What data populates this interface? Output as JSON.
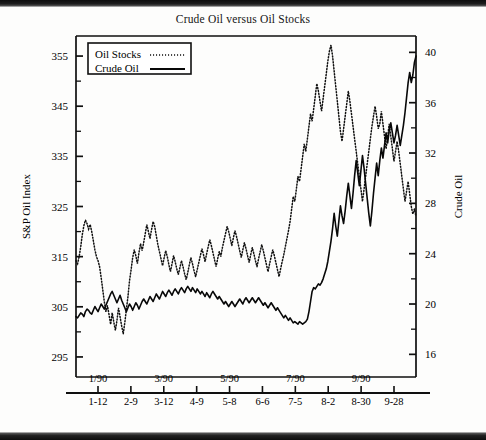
{
  "figure": {
    "title": "Crude Oil versus Oil Stocks",
    "left_axis_name": "S&P Oil Index",
    "right_axis_name": "Crude Oil"
  },
  "legend": {
    "items": [
      {
        "label": "Oil Stocks",
        "style": "dotted"
      },
      {
        "label": "Crude Oil",
        "style": "solid"
      }
    ]
  },
  "chart_data": {
    "type": "line",
    "title": "Crude Oil versus Oil Stocks",
    "xlabel": "",
    "ylabel": "S&P Oil Index",
    "y2label": "Crude Oil",
    "ylim": [
      291,
      359
    ],
    "y2lim": [
      14.2,
      41.3
    ],
    "yticks": [
      295,
      305,
      315,
      325,
      335,
      345,
      355
    ],
    "y2ticks": [
      16,
      20,
      24,
      28,
      32,
      36,
      40
    ],
    "yminor_step": 5,
    "y2minor_step": 2,
    "grid": false,
    "legend_position": "upper-left",
    "xlim": [
      0,
      38
    ],
    "xtick_major_labels": [
      "1/90",
      "3/90",
      "5/90",
      "7/90",
      "9/90"
    ],
    "xtick_major_positions": [
      3,
      11,
      19,
      27,
      35
    ],
    "xtick_labels": [
      "1-12",
      "2-9",
      "3-12",
      "4-9",
      "5-8",
      "6-6",
      "7-5",
      "8-2",
      "8-30",
      "9-28"
    ],
    "xtick_positions": [
      3,
      7,
      11,
      15,
      19,
      23,
      27,
      31,
      35,
      39
    ],
    "series": [
      {
        "name": "Oil Stocks",
        "axis": "left",
        "style": "dotted",
        "values": [
          314.2,
          313.6,
          315.0,
          317.0,
          319.4,
          321.2,
          322.3,
          321.6,
          320.5,
          321.4,
          320.0,
          318.2,
          316.4,
          315.0,
          314.2,
          313.0,
          310.8,
          308.4,
          306.0,
          304.0,
          305.2,
          303.4,
          301.5,
          303.8,
          302.0,
          300.3,
          302.2,
          304.8,
          303.0,
          301.2,
          299.6,
          301.8,
          304.5,
          307.0,
          310.2,
          312.4,
          314.8,
          316.4,
          315.2,
          313.6,
          315.8,
          317.6,
          316.2,
          317.8,
          319.6,
          321.4,
          320.0,
          318.6,
          320.4,
          322.0,
          321.0,
          319.2,
          317.4,
          316.0,
          314.6,
          313.2,
          314.8,
          316.2,
          315.0,
          313.4,
          312.0,
          313.6,
          315.2,
          314.0,
          312.6,
          311.4,
          312.8,
          314.2,
          313.0,
          311.6,
          310.4,
          311.8,
          313.4,
          314.8,
          313.6,
          312.2,
          311.0,
          312.4,
          313.8,
          315.2,
          316.6,
          315.4,
          314.0,
          315.6,
          317.0,
          318.4,
          317.2,
          315.8,
          314.4,
          313.0,
          314.6,
          316.0,
          315.0,
          316.8,
          318.2,
          319.6,
          321.0,
          320.0,
          318.6,
          317.2,
          318.8,
          320.2,
          319.0,
          317.6,
          316.2,
          314.8,
          316.4,
          317.8,
          316.6,
          315.2,
          313.8,
          315.4,
          316.8,
          315.6,
          314.2,
          313.0,
          314.6,
          316.0,
          317.4,
          316.2,
          314.8,
          313.4,
          312.0,
          313.6,
          315.0,
          316.4,
          315.2,
          313.8,
          312.4,
          311.0,
          312.6,
          314.0,
          315.4,
          317.0,
          318.6,
          320.2,
          322.0,
          324.5,
          327.0,
          326.0,
          328.5,
          331.0,
          330.0,
          332.5,
          335.0,
          337.5,
          336.0,
          338.5,
          341.0,
          343.5,
          342.0,
          344.5,
          347.0,
          349.5,
          348.0,
          346.0,
          344.0,
          346.5,
          349.0,
          351.5,
          354.0,
          356.0,
          357.2,
          355.0,
          352.0,
          349.0,
          346.0,
          343.0,
          340.0,
          338.0,
          340.5,
          343.0,
          345.5,
          348.0,
          346.0,
          343.5,
          341.0,
          338.5,
          336.0,
          333.5,
          331.0,
          328.5,
          326.0,
          328.5,
          331.0,
          333.5,
          336.0,
          338.5,
          341.0,
          343.0,
          345.0,
          343.0,
          340.5,
          341.5,
          344.0,
          341.5,
          339.0,
          336.5,
          339.0,
          341.5,
          339.0,
          336.5,
          334.0,
          336.0,
          338.0,
          336.0,
          333.5,
          331.0,
          328.5,
          326.0,
          328.0,
          330.0,
          327.5,
          325.0,
          323.5,
          324.5,
          323.0
        ]
      },
      {
        "name": "Crude Oil",
        "axis": "right",
        "style": "solid",
        "values": [
          19.0,
          18.9,
          19.1,
          19.3,
          19.2,
          19.0,
          19.4,
          19.6,
          19.5,
          19.3,
          19.2,
          19.5,
          19.8,
          19.6,
          19.4,
          19.7,
          20.0,
          19.8,
          19.6,
          19.9,
          20.2,
          20.5,
          20.8,
          21.0,
          20.7,
          20.4,
          20.1,
          20.4,
          20.7,
          20.3,
          20.0,
          19.7,
          19.4,
          19.7,
          20.0,
          19.8,
          19.5,
          19.8,
          20.1,
          19.9,
          19.6,
          19.9,
          20.2,
          20.4,
          20.2,
          20.0,
          20.3,
          20.6,
          20.4,
          20.2,
          20.5,
          20.8,
          20.6,
          20.4,
          20.7,
          21.0,
          20.8,
          20.6,
          20.9,
          21.1,
          20.9,
          20.7,
          21.0,
          21.2,
          21.0,
          20.8,
          21.1,
          21.3,
          21.1,
          20.9,
          21.2,
          21.4,
          21.2,
          21.0,
          21.3,
          21.1,
          20.9,
          21.2,
          21.0,
          20.8,
          21.0,
          20.8,
          20.6,
          20.9,
          20.7,
          20.5,
          20.8,
          21.0,
          20.8,
          20.6,
          20.4,
          20.6,
          20.4,
          20.2,
          20.0,
          20.2,
          20.0,
          19.8,
          20.0,
          20.2,
          20.0,
          19.8,
          20.0,
          20.2,
          20.4,
          20.2,
          20.0,
          20.3,
          20.5,
          20.3,
          20.1,
          20.3,
          20.5,
          20.3,
          20.1,
          20.3,
          20.5,
          20.3,
          20.1,
          19.9,
          20.1,
          19.9,
          19.7,
          19.9,
          20.1,
          19.9,
          19.7,
          19.5,
          19.7,
          19.5,
          19.3,
          19.1,
          18.9,
          19.1,
          18.9,
          18.7,
          18.9,
          18.7,
          18.5,
          18.6,
          18.5,
          18.4,
          18.6,
          18.5,
          18.4,
          18.5,
          18.6,
          18.8,
          19.4,
          20.2,
          21.0,
          21.3,
          21.2,
          21.4,
          21.6,
          21.5,
          21.7,
          22.0,
          22.4,
          22.8,
          23.4,
          24.2,
          25.0,
          26.0,
          27.2,
          26.2,
          25.4,
          26.6,
          27.8,
          27.0,
          26.4,
          27.4,
          28.6,
          29.6,
          28.6,
          27.6,
          28.8,
          30.2,
          31.4,
          30.4,
          29.4,
          30.6,
          31.8,
          30.8,
          29.6,
          28.4,
          27.2,
          26.2,
          27.4,
          28.8,
          30.0,
          31.2,
          30.2,
          31.4,
          32.4,
          31.6,
          32.6,
          33.6,
          32.8,
          33.8,
          34.4,
          33.6,
          32.8,
          33.4,
          34.2,
          33.4,
          32.6,
          33.4,
          34.2,
          35.2,
          36.4,
          37.6,
          38.4,
          37.6,
          38.2,
          39.2,
          39.7
        ]
      }
    ]
  }
}
